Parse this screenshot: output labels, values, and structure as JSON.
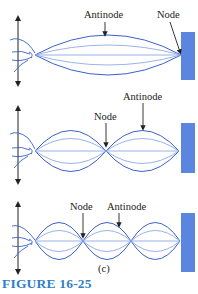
{
  "figure": {
    "caption": "FIGURE 16-25",
    "colors": {
      "string": "#3a5fcf",
      "string_light": "#7fa0e6",
      "wall": "#5b86e0",
      "arrow": "#222222",
      "caption": "#2f7fc4"
    },
    "panels": [
      {
        "id": "fundamental",
        "loops": 1,
        "labels": {
          "antinode": "Antinode",
          "node": "Node"
        }
      },
      {
        "id": "second-harmonic",
        "loops": 2,
        "labels": {
          "antinode": "Antinode",
          "node": "Node"
        }
      },
      {
        "id": "third-harmonic",
        "loops": 3,
        "labels": {
          "antinode": "Antinode",
          "node": "Node"
        },
        "sublabel": "(c)"
      }
    ]
  }
}
